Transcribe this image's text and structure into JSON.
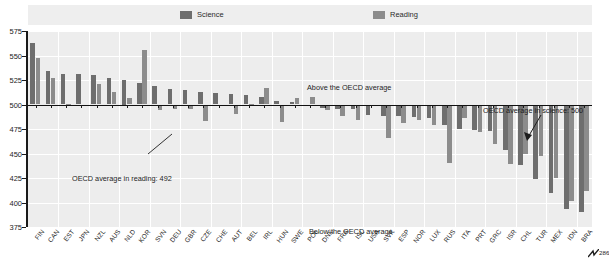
{
  "legend": {
    "items": [
      {
        "label": "Science",
        "color": "#6e6e6e",
        "icon": "square-swatch-icon"
      },
      {
        "label": "Reading",
        "color": "#8c8c8c",
        "icon": "square-swatch-icon"
      }
    ]
  },
  "annotations": {
    "above": "Above the OECD average",
    "below": "Below the OECD average",
    "reading_average": "OECD average in reading: 492",
    "science_average": "OECD average in science: 500",
    "break_value": "286"
  },
  "chart_data": {
    "type": "bar",
    "title": "",
    "subtitle": "",
    "xlabel": "",
    "ylabel": "",
    "ylim": [
      375,
      575
    ],
    "yticks": [
      375,
      400,
      425,
      450,
      475,
      500,
      525,
      550,
      575
    ],
    "grid": true,
    "legend_position": "top",
    "baseline": 500,
    "oecd_average_science": 500,
    "oecd_average_reading": 492,
    "categories": [
      "FIN",
      "CAN",
      "EST",
      "JPN",
      "NZL",
      "AUS",
      "NLD",
      "KOR",
      "SVN",
      "DEU",
      "GBR",
      "CZE",
      "CHE",
      "AUT",
      "BEL",
      "IRL",
      "HUN",
      "SWE",
      "POL",
      "DNK",
      "FRA",
      "ISL",
      "USA",
      "SVK",
      "ESP",
      "NOR",
      "LUX",
      "RUS",
      "ITA",
      "PRT",
      "GRC",
      "ISR",
      "CHL",
      "TUR",
      "MEX",
      "IDN",
      "BRA"
    ],
    "series": [
      {
        "name": "Science",
        "color": "#6e6e6e",
        "values": [
          563,
          534,
          531,
          531,
          530,
          527,
          525,
          522,
          519,
          516,
          515,
          513,
          512,
          511,
          510,
          508,
          504,
          503,
          498,
          496,
          495,
          495,
          489,
          488,
          488,
          487,
          486,
          479,
          475,
          474,
          473,
          454,
          438,
          424,
          410,
          393,
          390
        ]
      },
      {
        "name": "Reading",
        "color": "#8c8c8c",
        "values": [
          547,
          527,
          501,
          498,
          521,
          513,
          507,
          556,
          494,
          495,
          495,
          483,
          499,
          490,
          501,
          517,
          482,
          507,
          508,
          494,
          488,
          484,
          500,
          466,
          481,
          484,
          479,
          440,
          486,
          472,
          460,
          439,
          449,
          447,
          425,
          402,
          412
        ]
      }
    ]
  }
}
